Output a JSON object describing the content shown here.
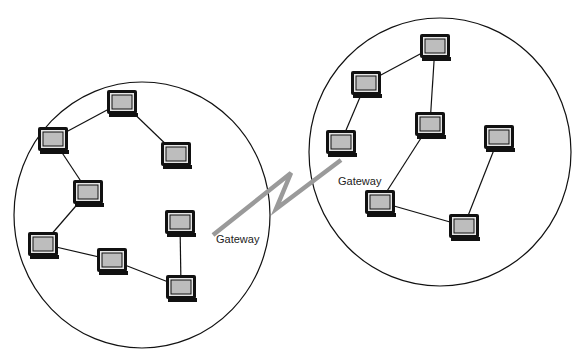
{
  "diagram": {
    "type": "network-topology",
    "colors": {
      "background": "#ffffff",
      "outline": "#111111",
      "screen": "#bdbdbd",
      "bezel": "#e6e6e6",
      "wan_link": "#9a9a9a"
    },
    "networks": [
      {
        "id": "left-network",
        "ellipse": {
          "cx": 142,
          "cy": 215,
          "rx": 128,
          "ry": 133
        },
        "nodes": [
          {
            "id": "L1",
            "x": 107,
            "y": 90
          },
          {
            "id": "L2",
            "x": 38,
            "y": 127
          },
          {
            "id": "L3",
            "x": 161,
            "y": 142
          },
          {
            "id": "L4",
            "x": 73,
            "y": 180
          },
          {
            "id": "L5",
            "x": 28,
            "y": 232
          },
          {
            "id": "L6",
            "x": 97,
            "y": 248
          },
          {
            "id": "LG",
            "x": 165,
            "y": 210,
            "gateway": true
          },
          {
            "id": "L7",
            "x": 166,
            "y": 275
          }
        ],
        "links": [
          [
            "L1",
            "L2"
          ],
          [
            "L1",
            "L3"
          ],
          [
            "L2",
            "L4"
          ],
          [
            "L4",
            "L5"
          ],
          [
            "L5",
            "L6"
          ],
          [
            "L6",
            "L7"
          ],
          [
            "LG",
            "L7"
          ]
        ]
      },
      {
        "id": "right-network",
        "ellipse": {
          "cx": 440,
          "cy": 152,
          "rx": 131,
          "ry": 134
        },
        "nodes": [
          {
            "id": "R1",
            "x": 420,
            "y": 34
          },
          {
            "id": "R2",
            "x": 351,
            "y": 71
          },
          {
            "id": "RG",
            "x": 326,
            "y": 130,
            "gateway": true
          },
          {
            "id": "R3",
            "x": 415,
            "y": 112
          },
          {
            "id": "R4",
            "x": 484,
            "y": 125
          },
          {
            "id": "R5",
            "x": 365,
            "y": 190
          },
          {
            "id": "R6",
            "x": 449,
            "y": 214
          }
        ],
        "links": [
          [
            "R1",
            "R2"
          ],
          [
            "R2",
            "RG"
          ],
          [
            "R1",
            "R3"
          ],
          [
            "R3",
            "R5"
          ],
          [
            "R5",
            "R6"
          ],
          [
            "R4",
            "R6"
          ]
        ]
      }
    ],
    "wan_link": {
      "points": [
        [
          213,
          235
        ],
        [
          291,
          173
        ],
        [
          276,
          209
        ],
        [
          341,
          160
        ]
      ]
    },
    "labels": {
      "left_gateway": "Gateway",
      "right_gateway": "Gateway"
    }
  }
}
